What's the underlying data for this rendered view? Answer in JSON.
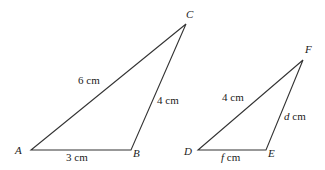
{
  "triangle_abc": {
    "vertices": {
      "A": "A",
      "B": "B",
      "C": "C"
    },
    "sides": {
      "AC": "6 cm",
      "BC": "4 cm",
      "AB": "3 cm"
    }
  },
  "triangle_def": {
    "vertices": {
      "D": "D",
      "E": "E",
      "F": "F"
    },
    "sides": {
      "DF": "4 cm",
      "EF_var": "d",
      "EF_unit": " cm",
      "DE_var": "f",
      "DE_unit": " cm"
    }
  },
  "colors": {
    "stroke": "#333333",
    "text": "#222222"
  }
}
